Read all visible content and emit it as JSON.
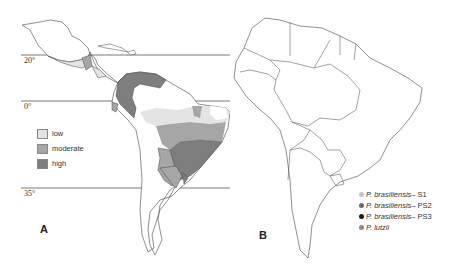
{
  "panelA": {
    "letter": "A",
    "latitudes": [
      {
        "label": "20°",
        "y": 55
      },
      {
        "label": "0°",
        "y": 101
      },
      {
        "label": "35°",
        "y": 188
      }
    ],
    "legend": [
      {
        "label": "low",
        "color": "#e4e4e4"
      },
      {
        "label": "moderate",
        "color": "#a6a6a6"
      },
      {
        "label": "high",
        "color": "#7e7e7e"
      }
    ]
  },
  "panelB": {
    "letter": "B",
    "legend": [
      {
        "species": "P. brasiliensis",
        "suffix": " – S1",
        "color": "#c4c4c4"
      },
      {
        "species": "P. brasiliensis",
        "suffix": " – PS2",
        "color": "#6a6a6a"
      },
      {
        "species": "P. brasiliensis",
        "suffix": " – PS3",
        "color": "#1a1a1a"
      },
      {
        "species": "P. lutzii",
        "suffix": "",
        "color": "#8a8a8a"
      }
    ]
  }
}
